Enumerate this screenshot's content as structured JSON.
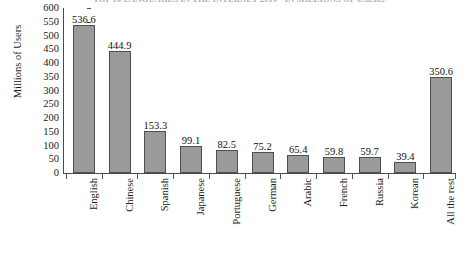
{
  "chart_data": {
    "type": "bar",
    "title": "TOP 10 LANGUAGES IN THE INTERNET 2010 - IN MILLIONS OF USERS",
    "xlabel": "",
    "ylabel": "Millions of Users",
    "ylim": [
      0,
      600
    ],
    "yticks": [
      600,
      550,
      500,
      450,
      400,
      350,
      300,
      250,
      200,
      150,
      100,
      50,
      0
    ],
    "grid": false,
    "legend": false,
    "bar_color": "#9a9a9a",
    "bar_border_color": "#4f4f4f",
    "categories": [
      "English",
      "Chinese",
      "Spanish",
      "Japanese",
      "Portuguese",
      "German",
      "Arabic",
      "French",
      "Russia",
      "Korean",
      "All the rest"
    ],
    "values": [
      536.6,
      444.9,
      153.3,
      99.1,
      82.5,
      75.2,
      65.4,
      59.8,
      59.7,
      39.4,
      350.6
    ],
    "value_labels": [
      "536.6",
      "444.9",
      "153.3",
      "99.1",
      "82.5",
      "75.2",
      "65.4",
      "59.8",
      "59.7",
      "39.4",
      "350.6"
    ]
  }
}
